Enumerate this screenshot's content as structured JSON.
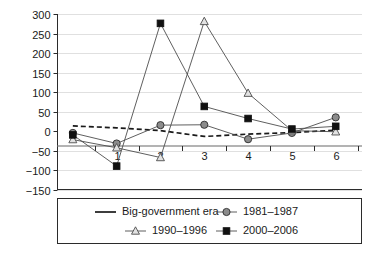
{
  "chart_data": {
    "type": "line",
    "title": "",
    "subtitle": "",
    "xlabel": "",
    "ylabel": "",
    "x": [
      0,
      1,
      2,
      3,
      4,
      5,
      6
    ],
    "xtick_labels": [
      "1",
      "2",
      "3",
      "4",
      "5",
      "6"
    ],
    "xtick_values": [
      1,
      2,
      3,
      4,
      5,
      6
    ],
    "ytick_labels": [
      "300",
      "250",
      "200",
      "150",
      "100",
      "50",
      "0",
      "−50",
      "−100",
      "−150"
    ],
    "ytick_values": [
      300,
      250,
      200,
      150,
      100,
      50,
      0,
      -50,
      -100,
      -150
    ],
    "ylim": [
      -150,
      300
    ],
    "xlim": [
      -0.35,
      6.6
    ],
    "grid": true,
    "grid_axis": "y",
    "legend_position": "bottom",
    "series": [
      {
        "name": "Big-government era",
        "marker": "none",
        "line_style": "dashed",
        "color": "#1a1a1a",
        "values": [
          13,
          8,
          1,
          -14,
          -8,
          -4,
          2
        ]
      },
      {
        "name": "1981–1987",
        "marker": "circle",
        "line_style": "solid",
        "color": "#8c8c8c",
        "values": [
          -5,
          -32,
          15,
          16,
          -21,
          -5,
          35
        ]
      },
      {
        "name": "1990–1996",
        "marker": "triangle",
        "line_style": "solid",
        "color": "#e2e2e2",
        "values": [
          -22,
          -43,
          -68,
          281,
          97,
          1,
          -2
        ]
      },
      {
        "name": "2000–2006",
        "marker": "square",
        "line_style": "solid",
        "color": "#111111",
        "values": [
          -10,
          -90,
          276,
          63,
          32,
          5,
          12
        ]
      }
    ]
  },
  "legend": {
    "items": [
      {
        "label": "Big-government era",
        "marker": "none-line"
      },
      {
        "label": "1981–1987",
        "marker": "circle"
      },
      {
        "label": "1990–1996",
        "marker": "triangle"
      },
      {
        "label": "2000–2006",
        "marker": "square"
      }
    ]
  },
  "colors": {
    "grid": "#d8d8d8",
    "axis": "#2b2b2b",
    "zero": "#9a9a9a",
    "background": "#ffffff"
  }
}
